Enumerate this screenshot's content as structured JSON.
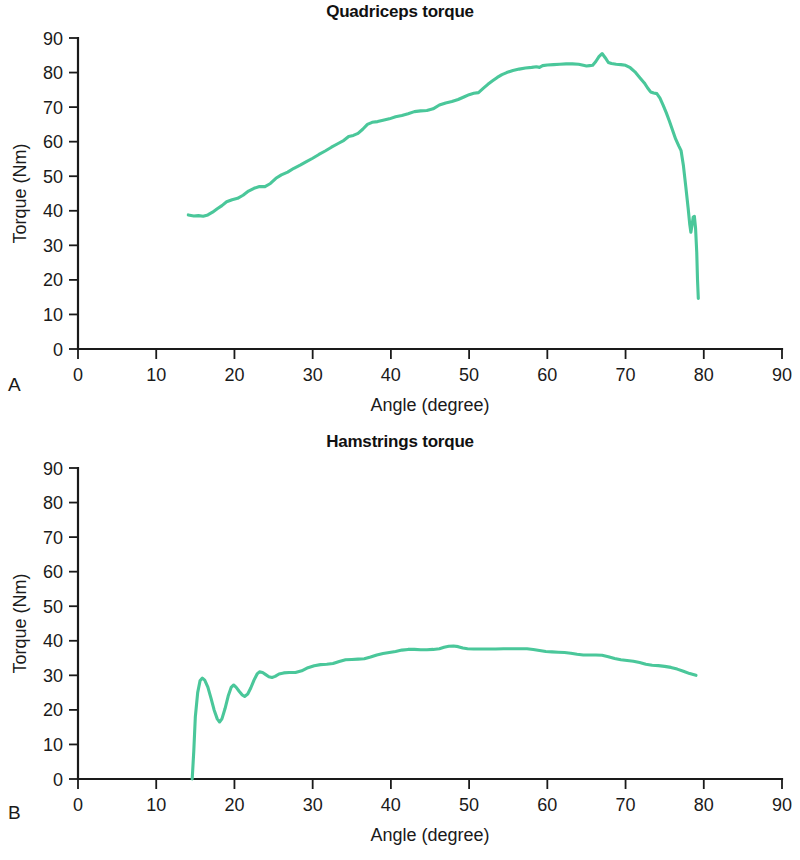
{
  "figure": {
    "background": "#ffffff",
    "line_color": "#4ac79a",
    "axis_color": "#1a1a1a"
  },
  "panels": [
    {
      "letter": "A",
      "title": "Quadriceps torque",
      "xlabel": "Angle (degree)",
      "ylabel": "Torque (Nm)"
    },
    {
      "letter": "B",
      "title": "Hamstrings torque",
      "xlabel": "Angle (degree)",
      "ylabel": "Torque (Nm)"
    }
  ],
  "axis": {
    "x_ticks": [
      0,
      10,
      20,
      30,
      40,
      50,
      60,
      70,
      80,
      90
    ],
    "y_ticks": [
      0,
      10,
      20,
      30,
      40,
      50,
      60,
      70,
      80,
      90
    ],
    "xlim": [
      0,
      90
    ],
    "ylim": [
      0,
      90
    ],
    "grid": false
  },
  "chart_data": [
    {
      "type": "line",
      "panel": "A",
      "title": "Quadriceps torque",
      "xlabel": "Angle (degree)",
      "ylabel": "Torque (Nm)",
      "xlim": [
        0,
        90
      ],
      "ylim": [
        0,
        90
      ],
      "grid": false,
      "legend": null,
      "series": [
        {
          "name": "Quadriceps torque",
          "color": "#4ac79a",
          "points": [
            [
              14.1,
              38.8
            ],
            [
              14.8,
              38.5
            ],
            [
              15.4,
              38.6
            ],
            [
              16.0,
              38.4
            ],
            [
              16.6,
              38.8
            ],
            [
              17.2,
              39.6
            ],
            [
              17.8,
              40.6
            ],
            [
              18.4,
              41.5
            ],
            [
              19.0,
              42.6
            ],
            [
              19.7,
              43.2
            ],
            [
              20.4,
              43.6
            ],
            [
              21.1,
              44.5
            ],
            [
              21.8,
              45.7
            ],
            [
              22.5,
              46.5
            ],
            [
              23.2,
              47.0
            ],
            [
              23.9,
              47.0
            ],
            [
              24.6,
              47.9
            ],
            [
              25.3,
              49.4
            ],
            [
              26.0,
              50.4
            ],
            [
              26.8,
              51.2
            ],
            [
              27.6,
              52.3
            ],
            [
              28.4,
              53.2
            ],
            [
              29.2,
              54.2
            ],
            [
              30.0,
              55.2
            ],
            [
              30.8,
              56.3
            ],
            [
              31.6,
              57.3
            ],
            [
              32.4,
              58.4
            ],
            [
              33.2,
              59.4
            ],
            [
              34.0,
              60.4
            ],
            [
              34.6,
              61.5
            ],
            [
              35.2,
              61.8
            ],
            [
              35.8,
              62.4
            ],
            [
              36.4,
              63.6
            ],
            [
              37.0,
              65.0
            ],
            [
              37.6,
              65.6
            ],
            [
              38.3,
              65.8
            ],
            [
              39.0,
              66.2
            ],
            [
              39.8,
              66.6
            ],
            [
              40.6,
              67.2
            ],
            [
              41.4,
              67.6
            ],
            [
              42.2,
              68.1
            ],
            [
              43.0,
              68.7
            ],
            [
              43.8,
              68.9
            ],
            [
              44.6,
              69.0
            ],
            [
              45.4,
              69.5
            ],
            [
              46.2,
              70.6
            ],
            [
              47.0,
              71.2
            ],
            [
              47.8,
              71.6
            ],
            [
              48.6,
              72.2
            ],
            [
              49.4,
              73.0
            ],
            [
              50.0,
              73.6
            ],
            [
              50.6,
              74.0
            ],
            [
              51.2,
              74.2
            ],
            [
              51.8,
              75.4
            ],
            [
              52.4,
              76.6
            ],
            [
              53.0,
              77.6
            ],
            [
              53.6,
              78.6
            ],
            [
              54.2,
              79.4
            ],
            [
              54.8,
              80.0
            ],
            [
              55.6,
              80.6
            ],
            [
              56.4,
              81.0
            ],
            [
              57.2,
              81.3
            ],
            [
              58.0,
              81.5
            ],
            [
              58.6,
              81.7
            ],
            [
              59.0,
              81.5
            ],
            [
              59.4,
              82.0
            ],
            [
              60.0,
              82.2
            ],
            [
              60.8,
              82.3
            ],
            [
              61.6,
              82.4
            ],
            [
              62.4,
              82.5
            ],
            [
              63.2,
              82.5
            ],
            [
              64.0,
              82.4
            ],
            [
              64.6,
              82.1
            ],
            [
              65.0,
              81.9
            ],
            [
              65.4,
              82.0
            ],
            [
              65.8,
              82.1
            ],
            [
              66.2,
              83.2
            ],
            [
              66.6,
              84.6
            ],
            [
              67.0,
              85.5
            ],
            [
              67.4,
              84.3
            ],
            [
              67.8,
              82.9
            ],
            [
              68.2,
              82.6
            ],
            [
              68.8,
              82.4
            ],
            [
              69.4,
              82.3
            ],
            [
              70.0,
              82.1
            ],
            [
              70.6,
              81.4
            ],
            [
              71.2,
              80.2
            ],
            [
              71.8,
              78.6
            ],
            [
              72.4,
              77.0
            ],
            [
              72.8,
              75.6
            ],
            [
              73.2,
              74.4
            ],
            [
              73.6,
              74.1
            ],
            [
              74.0,
              73.9
            ],
            [
              74.4,
              72.6
            ],
            [
              74.8,
              70.6
            ],
            [
              75.2,
              68.4
            ],
            [
              75.6,
              66.0
            ],
            [
              76.0,
              63.4
            ],
            [
              76.4,
              60.8
            ],
            [
              76.8,
              58.8
            ],
            [
              77.1,
              57.4
            ],
            [
              77.4,
              53.0
            ],
            [
              77.7,
              47.0
            ],
            [
              78.0,
              40.8
            ],
            [
              78.2,
              36.2
            ],
            [
              78.35,
              33.8
            ],
            [
              78.5,
              35.8
            ],
            [
              78.65,
              38.2
            ],
            [
              78.8,
              38.4
            ],
            [
              78.95,
              35.0
            ],
            [
              79.1,
              28.0
            ],
            [
              79.2,
              20.0
            ],
            [
              79.3,
              14.6
            ]
          ]
        }
      ]
    },
    {
      "type": "line",
      "panel": "B",
      "title": "Hamstrings torque",
      "xlabel": "Angle (degree)",
      "ylabel": "Torque (Nm)",
      "xlim": [
        0,
        90
      ],
      "ylim": [
        0,
        90
      ],
      "grid": false,
      "legend": null,
      "series": [
        {
          "name": "Hamstrings torque",
          "color": "#4ac79a",
          "points": [
            [
              14.6,
              0.0
            ],
            [
              14.8,
              8.0
            ],
            [
              15.0,
              18.0
            ],
            [
              15.3,
              25.0
            ],
            [
              15.6,
              28.4
            ],
            [
              15.9,
              29.2
            ],
            [
              16.2,
              28.6
            ],
            [
              16.6,
              26.6
            ],
            [
              17.0,
              23.4
            ],
            [
              17.4,
              20.0
            ],
            [
              17.8,
              17.4
            ],
            [
              18.1,
              16.5
            ],
            [
              18.4,
              17.4
            ],
            [
              18.8,
              20.4
            ],
            [
              19.2,
              24.0
            ],
            [
              19.6,
              26.6
            ],
            [
              19.9,
              27.2
            ],
            [
              20.2,
              26.6
            ],
            [
              20.6,
              25.4
            ],
            [
              21.0,
              24.3
            ],
            [
              21.3,
              23.9
            ],
            [
              21.7,
              24.6
            ],
            [
              22.1,
              26.4
            ],
            [
              22.5,
              28.6
            ],
            [
              22.9,
              30.4
            ],
            [
              23.2,
              31.0
            ],
            [
              23.6,
              30.8
            ],
            [
              24.0,
              30.2
            ],
            [
              24.4,
              29.6
            ],
            [
              24.8,
              29.4
            ],
            [
              25.2,
              29.7
            ],
            [
              25.7,
              30.4
            ],
            [
              26.3,
              30.7
            ],
            [
              27.0,
              30.8
            ],
            [
              27.8,
              30.8
            ],
            [
              28.6,
              31.3
            ],
            [
              29.4,
              32.2
            ],
            [
              30.2,
              32.8
            ],
            [
              31.0,
              33.1
            ],
            [
              31.8,
              33.2
            ],
            [
              32.6,
              33.4
            ],
            [
              33.4,
              34.0
            ],
            [
              34.2,
              34.5
            ],
            [
              35.0,
              34.6
            ],
            [
              35.8,
              34.7
            ],
            [
              36.6,
              34.8
            ],
            [
              37.4,
              35.3
            ],
            [
              38.2,
              35.9
            ],
            [
              39.0,
              36.3
            ],
            [
              39.8,
              36.6
            ],
            [
              40.6,
              36.9
            ],
            [
              41.4,
              37.3
            ],
            [
              42.2,
              37.5
            ],
            [
              43.0,
              37.5
            ],
            [
              43.8,
              37.4
            ],
            [
              44.6,
              37.4
            ],
            [
              45.4,
              37.5
            ],
            [
              46.2,
              37.7
            ],
            [
              46.8,
              38.1
            ],
            [
              47.4,
              38.4
            ],
            [
              48.0,
              38.5
            ],
            [
              48.6,
              38.3
            ],
            [
              49.2,
              37.9
            ],
            [
              49.8,
              37.7
            ],
            [
              50.6,
              37.6
            ],
            [
              51.4,
              37.6
            ],
            [
              52.4,
              37.6
            ],
            [
              53.4,
              37.6
            ],
            [
              54.4,
              37.7
            ],
            [
              55.4,
              37.7
            ],
            [
              56.4,
              37.7
            ],
            [
              57.4,
              37.7
            ],
            [
              58.2,
              37.5
            ],
            [
              59.0,
              37.2
            ],
            [
              59.8,
              36.9
            ],
            [
              60.6,
              36.8
            ],
            [
              61.4,
              36.7
            ],
            [
              62.2,
              36.6
            ],
            [
              63.0,
              36.4
            ],
            [
              63.8,
              36.1
            ],
            [
              64.6,
              35.9
            ],
            [
              65.4,
              35.9
            ],
            [
              66.2,
              35.9
            ],
            [
              67.0,
              35.8
            ],
            [
              67.8,
              35.4
            ],
            [
              68.6,
              34.9
            ],
            [
              69.4,
              34.5
            ],
            [
              70.2,
              34.3
            ],
            [
              71.0,
              34.1
            ],
            [
              71.8,
              33.7
            ],
            [
              72.6,
              33.2
            ],
            [
              73.4,
              32.9
            ],
            [
              74.2,
              32.8
            ],
            [
              75.0,
              32.6
            ],
            [
              75.8,
              32.3
            ],
            [
              76.6,
              31.8
            ],
            [
              77.4,
              31.2
            ],
            [
              78.2,
              30.5
            ],
            [
              79.0,
              30.0
            ]
          ]
        }
      ]
    }
  ]
}
